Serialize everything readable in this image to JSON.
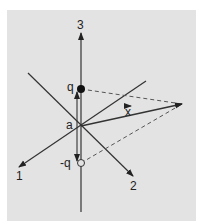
{
  "diagram": {
    "axes": [
      {
        "id": "1",
        "label": "1"
      },
      {
        "id": "2",
        "label": "2"
      },
      {
        "id": "3",
        "label": "3"
      }
    ],
    "labels": {
      "origin": "a",
      "positive_charge": "q",
      "negative_charge": "-q",
      "vector": "x"
    },
    "colors": {
      "background": "#e3e3e3",
      "lines": "#333333",
      "dashed": "#555555"
    }
  }
}
